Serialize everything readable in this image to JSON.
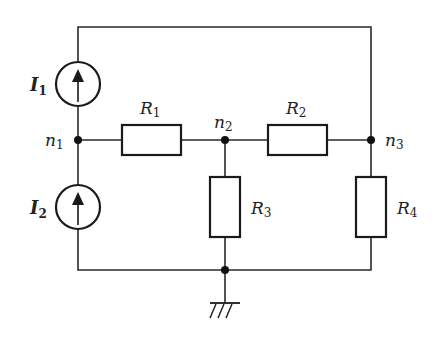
{
  "diagram": {
    "type": "electrical-circuit",
    "current_sources": [
      {
        "name": "I",
        "sub": "1",
        "direction": "up"
      },
      {
        "name": "I",
        "sub": "2",
        "direction": "up"
      }
    ],
    "resistors": [
      {
        "name": "R",
        "sub": "1"
      },
      {
        "name": "R",
        "sub": "2"
      },
      {
        "name": "R",
        "sub": "3"
      },
      {
        "name": "R",
        "sub": "4"
      }
    ],
    "nodes": [
      {
        "name": "n",
        "sub": "1"
      },
      {
        "name": "n",
        "sub": "2"
      },
      {
        "name": "n",
        "sub": "3"
      }
    ],
    "ground": "ground-symbol",
    "colors": {
      "line": "#1a1a1a",
      "background": "#ffffff"
    }
  }
}
